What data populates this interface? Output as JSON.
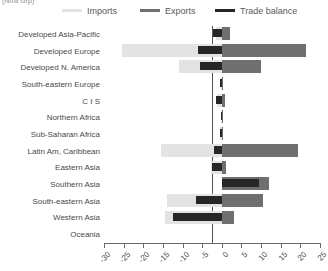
{
  "caption": {
    "clipped_text": "(Nmil Grp)"
  },
  "legend": {
    "position": "top",
    "items": [
      {
        "label": "Imports",
        "color": "#e3e3e3",
        "name": "imports"
      },
      {
        "label": "Exports",
        "color": "#6f6f6f",
        "name": "exports"
      },
      {
        "label": "Trade balance",
        "color": "#262626",
        "name": "trade-balance"
      }
    ]
  },
  "axis": {
    "xlabel": "",
    "ylabel": "",
    "xlim": [
      -30,
      25
    ],
    "xticks": [
      -30,
      -25,
      -20,
      -15,
      -10,
      -5,
      0,
      5,
      10,
      15,
      20,
      25
    ],
    "xtick_labels": [
      "-30",
      "-25",
      "-20",
      "-15",
      "-10",
      "-5",
      "0",
      "5",
      "10",
      "15",
      "20",
      "25"
    ],
    "grid": false
  },
  "chart_data": {
    "type": "bar",
    "orientation": "horizontal",
    "title": "",
    "subtitle": "",
    "xlabel": "",
    "ylabel": "",
    "xlim": [
      -30,
      25
    ],
    "grid": false,
    "legend_position": "top",
    "categories": [
      "Developed Asia-Pacific",
      "Developed Europe",
      "Developed N. America",
      "South-eastern Europe",
      "C I S",
      "Northern Africa",
      "Sub-Saharan Africa",
      "Latin Am, Caribbean",
      "Eastern Asia",
      "Southern Asia",
      "South-eastern Asia",
      "Western Asia",
      "Oceania"
    ],
    "series": [
      {
        "name": "Imports",
        "color": "#e3e3e3",
        "values": [
          -1.5,
          -25.5,
          -11.0,
          -0.3,
          -1.2,
          -0.3,
          -0.4,
          -15.5,
          -2.7,
          0.0,
          -14.0,
          -14.5,
          0.0
        ]
      },
      {
        "name": "Exports",
        "color": "#6f6f6f",
        "values": [
          2.0,
          21.5,
          10.0,
          0.4,
          0.8,
          0.3,
          0.4,
          19.5,
          1.0,
          12.0,
          10.5,
          3.0,
          0.0
        ]
      },
      {
        "name": "Trade balance",
        "color": "#262626",
        "values": [
          -2.2,
          -6.0,
          -5.5,
          -0.4,
          -1.5,
          -0.3,
          -0.4,
          -2.0,
          -2.4,
          9.5,
          -6.5,
          -12.5,
          0.0
        ]
      }
    ]
  }
}
